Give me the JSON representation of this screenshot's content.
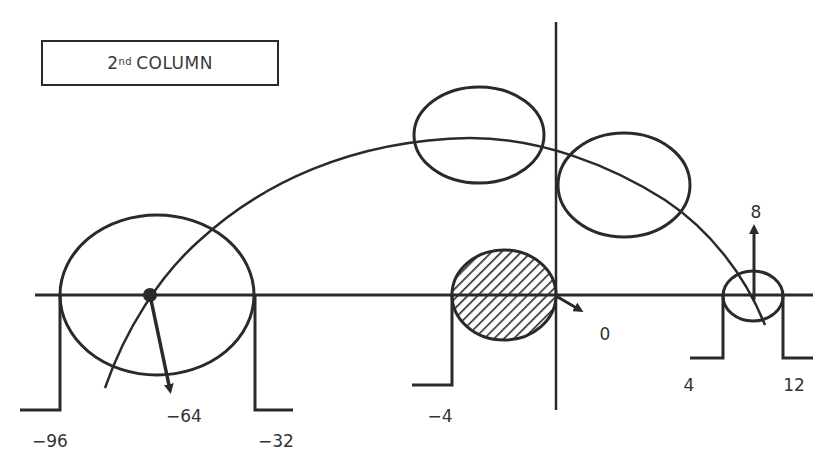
{
  "title": {
    "ordinal_number": "2",
    "ordinal_suffix": "nd",
    "text": "COLUMN"
  },
  "colors": {
    "stroke": "#2a2a2a",
    "label": "#333333",
    "background": "#ffffff"
  },
  "labels": {
    "minus_96": "−96",
    "minus_64": "−64",
    "minus_32": "−32",
    "minus_4": "−4",
    "zero": "0",
    "eight": "8",
    "four": "4",
    "twelve": "12"
  },
  "elements": {
    "large_circle": {
      "description": "large circle spanning -96 to -32, center -64"
    },
    "hatched_circle": {
      "description": "hatched filled circle from -4 to 0"
    },
    "upper_left_ellipse": {
      "description": "ellipse at apex of arc, left of vertical axis"
    },
    "upper_right_ellipse": {
      "description": "ellipse on arc, right of vertical axis"
    },
    "small_circle": {
      "description": "small circle spanning 4 to 12, arrow up to 8"
    },
    "arc": {
      "description": "large arc trajectory from lower left through apex to lower right"
    }
  }
}
